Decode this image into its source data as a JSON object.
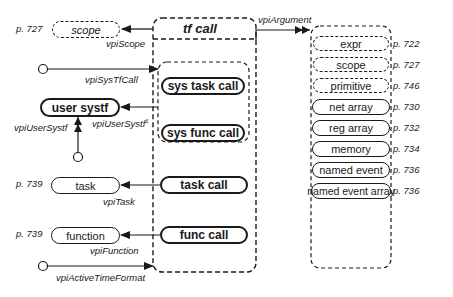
{
  "diagram": {
    "center": {
      "title": "tf call"
    },
    "subgroup": [
      {
        "label": "sys task call"
      },
      {
        "label": "sys func call"
      }
    ],
    "center_items": [
      {
        "label": "task call"
      },
      {
        "label": "func call"
      }
    ],
    "left": {
      "scope": {
        "label": "scope",
        "page": "p. 727",
        "edge": "vpiScope"
      },
      "sys_tf_call": {
        "edge": "vpiSysTfCall"
      },
      "user_systf": {
        "label": "user systf",
        "edge_in": "vpiUserSystf",
        "edge_out": "vpiUserSystf",
        "footnote": "1"
      },
      "task": {
        "label": "task",
        "page": "p. 739",
        "edge": "vpiTask"
      },
      "function": {
        "label": "function",
        "page": "p. 739",
        "edge": "vpiFunction"
      },
      "active_time_format": {
        "edge": "vpiActiveTimeFormat"
      }
    },
    "argument": {
      "edge": "vpiArgument",
      "items": [
        {
          "label": "expr",
          "page": "p. 722",
          "style": "dashed"
        },
        {
          "label": "scope",
          "page": "p. 727",
          "style": "dashed"
        },
        {
          "label": "primitive",
          "page": "p. 746",
          "style": "dashed"
        },
        {
          "label": "net array",
          "page": "p. 730",
          "style": "solid"
        },
        {
          "label": "reg array",
          "page": "p. 732",
          "style": "solid"
        },
        {
          "label": "memory",
          "page": "p. 734",
          "style": "solid"
        },
        {
          "label": "named event",
          "page": "p. 736",
          "style": "solid"
        },
        {
          "label": "named event array",
          "page": "p. 736",
          "style": "solid"
        }
      ]
    }
  }
}
